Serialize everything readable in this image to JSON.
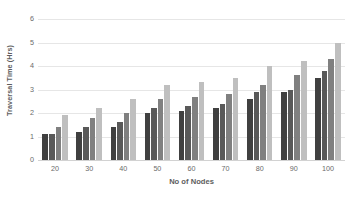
{
  "chart_data": {
    "type": "bar",
    "title": "",
    "xlabel": "No of Nodes",
    "ylabel": "Traversal Time (Hrs)",
    "categories": [
      "20",
      "30",
      "40",
      "50",
      "60",
      "70",
      "80",
      "90",
      "100"
    ],
    "series": [
      {
        "name": "Series 1",
        "color": "#404040",
        "values": [
          1.1,
          1.2,
          1.4,
          2.0,
          2.1,
          2.2,
          2.6,
          2.9,
          3.5
        ]
      },
      {
        "name": "Series 2",
        "color": "#595959",
        "values": [
          1.1,
          1.4,
          1.6,
          2.2,
          2.3,
          2.4,
          2.9,
          3.0,
          3.8
        ]
      },
      {
        "name": "Series 3",
        "color": "#808080",
        "values": [
          1.4,
          1.8,
          2.0,
          2.6,
          2.7,
          2.8,
          3.2,
          3.6,
          4.3
        ]
      },
      {
        "name": "Series 4",
        "color": "#bfbfbf",
        "values": [
          1.9,
          2.2,
          2.6,
          3.2,
          3.3,
          3.5,
          4.0,
          4.2,
          5.0
        ]
      }
    ],
    "ylim": [
      0,
      6
    ],
    "yticks": [
      0,
      1,
      2,
      3,
      4,
      5,
      6
    ],
    "ytick_labels": [
      "0",
      "1",
      "2",
      "3",
      "4",
      "5",
      "6"
    ],
    "grid": true,
    "gridline_color": "#e6e6e6",
    "legend": "none",
    "background": "#ffffff"
  }
}
